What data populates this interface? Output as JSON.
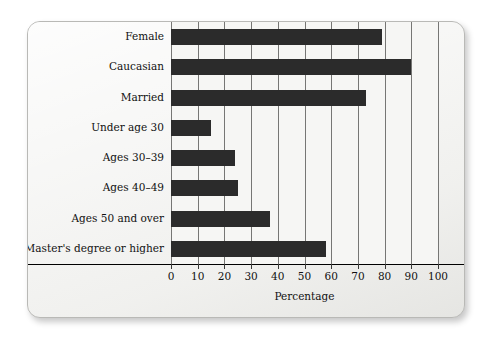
{
  "chart_data": {
    "type": "bar",
    "orientation": "horizontal",
    "title": "",
    "xlabel": "Percentage",
    "ylabel": "",
    "xlim": [
      0,
      100
    ],
    "xticks": [
      0,
      10,
      20,
      30,
      40,
      50,
      60,
      70,
      80,
      90,
      100
    ],
    "grid": "vertical",
    "legend": "none",
    "bar_color": "#2b2b2b",
    "categories": [
      "Female",
      "Caucasian",
      "Married",
      "Under age 30",
      "Ages 30–39",
      "Ages 40–49",
      "Ages 50 and over",
      "Master's degree or higher"
    ],
    "values": [
      79,
      90,
      73,
      15,
      24,
      25,
      37,
      58
    ]
  },
  "figure": {
    "background_color": "#ffffff",
    "card_color": "#f2f2f0",
    "plot_background": "#f6f6f4",
    "gridline_color": "#767674",
    "axis_color": "#000000"
  }
}
